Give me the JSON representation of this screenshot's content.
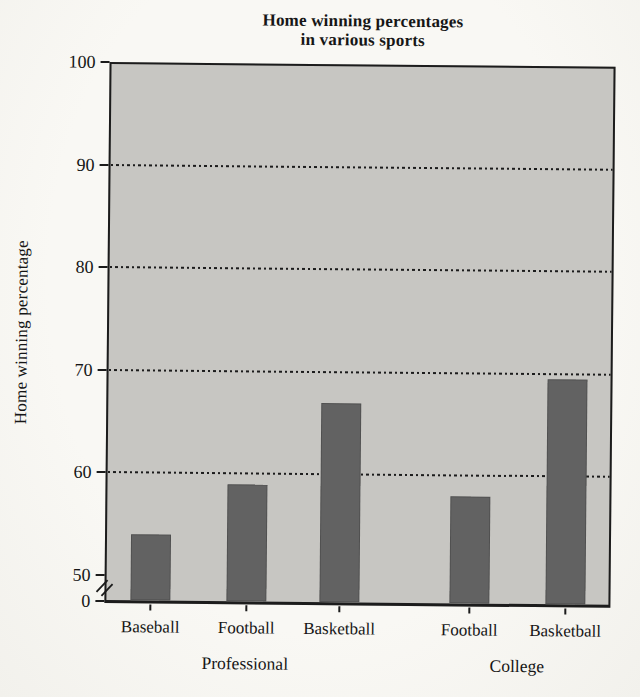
{
  "title": {
    "line1": "Home winning percentages",
    "line2": "in various sports"
  },
  "y_axis": {
    "label": "Home winning percentage",
    "tick_labels": [
      "100",
      "90",
      "80",
      "70",
      "60",
      "50",
      "0"
    ],
    "axis_break_between": [
      "0",
      "50"
    ]
  },
  "x_axis": {
    "categories": [
      "Baseball",
      "Football",
      "Basketball",
      "Football",
      "Basketball"
    ],
    "group_labels": [
      "Professional",
      "College"
    ]
  },
  "chart_data": {
    "type": "bar",
    "title": "Home winning percentages in various sports",
    "xlabel": "",
    "ylabel": "Home winning percentage",
    "categories": [
      "Baseball",
      "Football",
      "Basketball",
      "Football",
      "Basketball"
    ],
    "values": [
      54,
      59,
      67,
      58,
      69.5
    ],
    "groups": [
      {
        "label": "Professional",
        "categories": [
          "Baseball",
          "Football",
          "Basketball"
        ],
        "values": [
          54,
          59,
          67
        ]
      },
      {
        "label": "College",
        "categories": [
          "Football",
          "Basketball"
        ],
        "values": [
          58,
          69.5
        ]
      }
    ],
    "yticks": [
      100,
      90,
      80,
      70,
      60,
      50,
      0
    ],
    "ylim": [
      0,
      100
    ],
    "display_ylim": [
      50,
      100
    ],
    "axis_break": true,
    "gridlines": {
      "at": [
        90,
        80,
        70,
        60
      ],
      "style": "dotted",
      "orientation": "horizontal"
    },
    "legend": "none",
    "colors": {
      "bar": "#626262",
      "plot_background": "#c7c6c2",
      "axis": "#1b1b1b",
      "text": "#161616",
      "page_background": "#f7f6f2"
    }
  }
}
